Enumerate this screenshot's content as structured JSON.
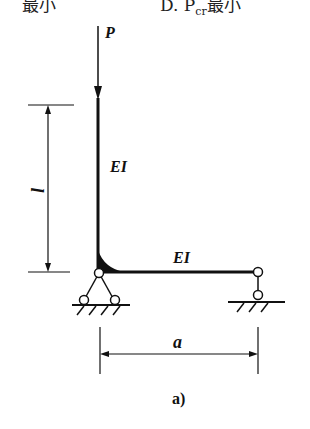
{
  "header": {
    "left_fragment": "最小",
    "right_fragment": "D. P",
    "right_subscript": "cr",
    "right_suffix": "最小"
  },
  "diagram": {
    "load_label": "P",
    "column_label": "EI",
    "beam_label": "EI",
    "height_dim_label": "l",
    "span_dim_label": "a",
    "caption": "a)",
    "colors": {
      "line": "#111111",
      "background": "#ffffff"
    }
  }
}
